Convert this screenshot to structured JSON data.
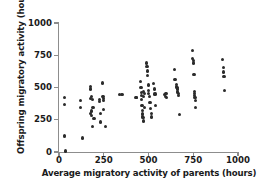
{
  "chart_data": {
    "type": "scatter",
    "title": "",
    "xlabel": "Average migratory activity of parents (hours)",
    "ylabel": "Offspring migratory activity (hours)",
    "xlim": [
      0,
      1000
    ],
    "ylim": [
      0,
      1000
    ],
    "xticks": [
      0,
      250,
      500,
      750,
      1000
    ],
    "yticks": [
      0,
      250,
      500,
      750,
      1000
    ],
    "xtick_labels": [
      "0",
      "250",
      "500",
      "750",
      "1000"
    ],
    "ytick_labels": [
      "0",
      "250",
      "500",
      "750",
      "1000"
    ],
    "grid": false,
    "legend": null,
    "marker_color": "#2b2b2b",
    "axis_color": "#8d8d8d",
    "background_color": "#ffffff",
    "n_points": 93,
    "points": [
      [
        30,
        420
      ],
      [
        30,
        370
      ],
      [
        32,
        130
      ],
      [
        32,
        118
      ],
      [
        38,
        8
      ],
      [
        120,
        345
      ],
      [
        122,
        400
      ],
      [
        130,
        108
      ],
      [
        175,
        300
      ],
      [
        176,
        412
      ],
      [
        178,
        505
      ],
      [
        178,
        488
      ],
      [
        180,
        430
      ],
      [
        182,
        318
      ],
      [
        183,
        282
      ],
      [
        185,
        196
      ],
      [
        188,
        410
      ],
      [
        190,
        345
      ],
      [
        196,
        262
      ],
      [
        225,
        410
      ],
      [
        228,
        390
      ],
      [
        230,
        300
      ],
      [
        232,
        232
      ],
      [
        245,
        535
      ],
      [
        246,
        432
      ],
      [
        247,
        415
      ],
      [
        248,
        398
      ],
      [
        250,
        327
      ],
      [
        258,
        200
      ],
      [
        340,
        448
      ],
      [
        352,
        445
      ],
      [
        430,
        422
      ],
      [
        432,
        425
      ],
      [
        455,
        545
      ],
      [
        458,
        497
      ],
      [
        460,
        462
      ],
      [
        462,
        440
      ],
      [
        463,
        405
      ],
      [
        464,
        362
      ],
      [
        465,
        320
      ],
      [
        466,
        300
      ],
      [
        467,
        288
      ],
      [
        468,
        278
      ],
      [
        469,
        268
      ],
      [
        470,
        240
      ],
      [
        472,
        432
      ],
      [
        474,
        468
      ],
      [
        476,
        452
      ],
      [
        478,
        346
      ],
      [
        490,
        690
      ],
      [
        492,
        665
      ],
      [
        494,
        628
      ],
      [
        496,
        592
      ],
      [
        498,
        520
      ],
      [
        500,
        478
      ],
      [
        502,
        455
      ],
      [
        505,
        433
      ],
      [
        508,
        385
      ],
      [
        510,
        340
      ],
      [
        515,
        298
      ],
      [
        518,
        272
      ],
      [
        530,
        530
      ],
      [
        534,
        488
      ],
      [
        536,
        450
      ],
      [
        540,
        362
      ],
      [
        590,
        448
      ],
      [
        594,
        432
      ],
      [
        598,
        455
      ],
      [
        600,
        420
      ],
      [
        645,
        640
      ],
      [
        648,
        560
      ],
      [
        655,
        525
      ],
      [
        657,
        508
      ],
      [
        659,
        498
      ],
      [
        660,
        488
      ],
      [
        662,
        470
      ],
      [
        664,
        462
      ],
      [
        666,
        452
      ],
      [
        668,
        440
      ],
      [
        672,
        288
      ],
      [
        745,
        788
      ],
      [
        748,
        725
      ],
      [
        750,
        710
      ],
      [
        752,
        690
      ],
      [
        754,
        600
      ],
      [
        756,
        470
      ],
      [
        757,
        455
      ],
      [
        758,
        440
      ],
      [
        760,
        425
      ],
      [
        762,
        400
      ],
      [
        764,
        348
      ],
      [
        915,
        720
      ],
      [
        918,
        655
      ],
      [
        920,
        620
      ],
      [
        922,
        588
      ],
      [
        925,
        478
      ]
    ]
  }
}
